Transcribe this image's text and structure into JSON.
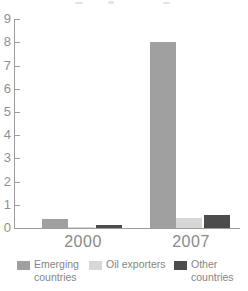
{
  "chart_data": {
    "type": "bar",
    "title": "",
    "xlabel": "",
    "ylabel": "",
    "categories": [
      "2000",
      "2007"
    ],
    "series": [
      {
        "name": "Emerging countries",
        "color": "#a0a0a0",
        "values": [
          0.4,
          8.0
        ]
      },
      {
        "name": "Oil exporters",
        "color": "#d7d7d7",
        "values": [
          0.05,
          0.45
        ]
      },
      {
        "name": "Other countries",
        "color": "#4c4c4c",
        "values": [
          0.15,
          0.55
        ]
      }
    ],
    "ylim": [
      0,
      9
    ],
    "y_ticks": [
      0,
      1,
      2,
      3,
      4,
      5,
      6,
      7,
      8,
      9
    ],
    "grid": false,
    "legend_position": "bottom"
  },
  "legend": {
    "items": [
      {
        "lines": "Emerging\ncountries"
      },
      {
        "lines": "Oil exporters"
      },
      {
        "lines": "Other\ncountries"
      }
    ]
  }
}
